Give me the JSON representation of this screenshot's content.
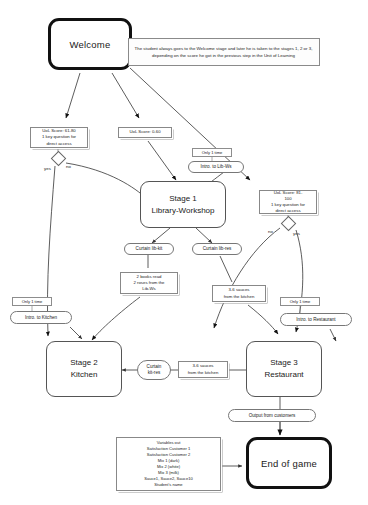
{
  "diagram": {
    "nodes": {
      "welcome": {
        "label": "Welcome"
      },
      "stage1": {
        "line1": "Stage 1",
        "line2": "Library-Workshop"
      },
      "stage2": {
        "line1": "Stage 2",
        "line2": "Kitchen"
      },
      "stage3": {
        "line1": "Stage 3",
        "line2": "Restaurant"
      },
      "end": {
        "label": "End of game"
      }
    },
    "annotations": {
      "welcome_note": "The student always goes to the Welcome stage and later he is taken to the stages 1, 2 or 3, depending on the score he got in the previous step in the Unit of Learning",
      "score_61_80": "UoL Score: 61-80\n1 key question for direct access",
      "score_61_80_l1": "UoL Score: 61-80",
      "score_61_80_l2": "1 key question for",
      "score_61_80_l3": "direct access",
      "score_0_60": "UoL Score: 0-60",
      "score_81_100_l1": "UoL Score: 81-",
      "score_81_100_l2": "100",
      "score_81_100_l3": "1 key question for",
      "score_81_100_l4": "direct access",
      "books_l1": "2 books read",
      "books_l2": "2 roses from the",
      "books_l3": "Lib-Ws",
      "sauces_right_l1": "3-6 sauces",
      "sauces_right_l2": "from the kitchen",
      "sauces_mid_l1": "3-6 sauces",
      "sauces_mid_l2": "from the kitchen",
      "variables_out": {
        "header": "Variables out",
        "lines": [
          "Satisfaction Customer 1",
          "Satisfaction Customer 2",
          "Mix 1 (dark)",
          "Mix 2 (white)",
          "Mix 3 (milk)",
          "Sauce1, Sauce2, Sauce10",
          "Student's name"
        ]
      }
    },
    "events": {
      "intro_libws": "Intro. to Lib-Ws",
      "intro_kitchen": "Intro. to Kitchen",
      "intro_restaurant": "Intro. to Restaurant",
      "curtain_lib_kit": "Curtain lib-kit",
      "curtain_lib_res": "Curtain lib-res",
      "curtain_kit_res_l1": "Curtain",
      "curtain_kit_res_l2": "kit-res",
      "output_customers": "Output from customers"
    },
    "tags": {
      "only_once_libws": "Only 1 time",
      "only_once_kitchen": "Only 1 time",
      "only_once_restaurant": "Only 1 time"
    },
    "decision_labels": {
      "yes_left": "yes",
      "no_left": "no",
      "no_right": "no",
      "yes_right": "yes"
    },
    "colors": {
      "stroke": "#333333",
      "thick_stroke": "#111111",
      "note_border": "#888888",
      "background": "#ffffff"
    }
  }
}
